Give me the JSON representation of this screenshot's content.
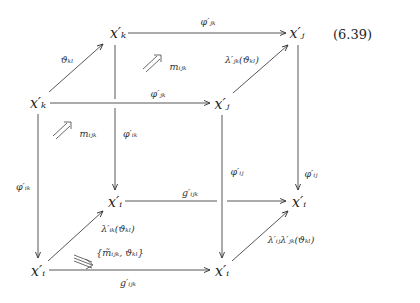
{
  "equation_number": "(6.39)",
  "nodes": {
    "front_top_left": "x′ₖ",
    "back_top_left": "x′ₖ",
    "back_top_right": "x′ⱼ",
    "front_top_right": "x′ⱼ",
    "back_bottom_left": "x′ᵢ",
    "back_bottom_right": "x′ᵢ",
    "front_bottom_left": "x′ᵢ",
    "front_bottom_right": "x′ᵢ"
  },
  "edges": {
    "theta_kl": "ϑₖₗ",
    "back_top_phi_jk": "φ′ⱼₖ",
    "lambda_jk_theta": "λ′ⱼₖ(ϑₖₗ)",
    "front_top_phi_jk": "φ′ⱼₖ",
    "back_left_phi_ik": "φ′ᵢₖ",
    "front_left_phi_ik": "φ′ᵢₖ",
    "back_right_phi_ij": "φ′ᵢⱼ",
    "front_right_phi_ij": "φ′ᵢⱼ",
    "back_bottom_g_ijk": "g′ᵢⱼₖ",
    "front_bottom_g_ijk": "g′ᵢⱼₖ",
    "lambda_ik_theta": "λ′ᵢₖ(ϑₖₗ)",
    "lambda_ij_lambda_jk_theta": "λ′ᵢⱼλ′ⱼₖ(ϑₖₗ)"
  },
  "two_cells": {
    "back_face": "mᵢⱼₖ",
    "left_face": "mᵢⱼₖ",
    "bottom_face": "{m̃ᵢⱼₖ, ϑₖₗ}"
  }
}
